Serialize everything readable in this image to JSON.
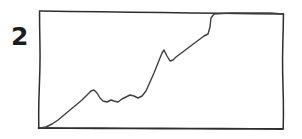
{
  "figure": {
    "label": "2",
    "label_color": "#1c1c1c",
    "background_color": "#ffffff",
    "ink_color": "#3f3f3f",
    "frame_color": "#2e2e2e",
    "width": 302,
    "height": 139
  },
  "chart_data": {
    "type": "line",
    "title": "",
    "subtitle": "",
    "xlabel": "",
    "ylabel": "",
    "annotations": [
      "2"
    ],
    "legend": [],
    "legend_position": "none",
    "grid": false,
    "axis_ticks": false,
    "tick_labels": [],
    "style": "hand-drawn sketch, monotone pencil line inside a hand-drawn rectangular frame",
    "xlim": [
      0,
      100
    ],
    "ylim": [
      0,
      100
    ],
    "x": [
      0,
      4,
      9,
      14,
      19,
      23,
      26,
      28,
      30,
      32,
      34,
      36,
      39,
      42,
      45,
      48,
      52,
      55,
      58,
      61,
      64,
      67,
      70,
      73,
      76,
      79,
      82,
      85,
      88,
      100
    ],
    "y": [
      0,
      2,
      9,
      17,
      24,
      31,
      35,
      32,
      28,
      27,
      29,
      27,
      30,
      33,
      32,
      30,
      36,
      48,
      60,
      72,
      68,
      64,
      66,
      71,
      76,
      81,
      86,
      97,
      98,
      98
    ],
    "series": [
      {
        "name": "sketched trend",
        "color": "#3f3f3f",
        "values": [
          0,
          2,
          9,
          17,
          24,
          31,
          35,
          32,
          28,
          27,
          29,
          27,
          30,
          33,
          32,
          30,
          36,
          48,
          60,
          72,
          68,
          64,
          66,
          71,
          76,
          81,
          86,
          97,
          98,
          98
        ]
      }
    ],
    "frame": {
      "top_left": [
        40,
        11
      ],
      "top_right": [
        283,
        14
      ],
      "bottom_right": [
        283,
        129
      ],
      "bottom_left": [
        39,
        128
      ]
    },
    "path_points_px": [
      [
        40,
        128
      ],
      [
        46,
        127
      ],
      [
        52,
        124
      ],
      [
        58,
        120
      ],
      [
        64,
        115
      ],
      [
        70,
        110
      ],
      [
        76,
        105
      ],
      [
        82,
        100
      ],
      [
        87,
        95
      ],
      [
        91,
        91
      ],
      [
        94,
        90
      ],
      [
        97,
        93
      ],
      [
        100,
        98
      ],
      [
        103,
        101
      ],
      [
        107,
        102
      ],
      [
        111,
        100
      ],
      [
        114,
        101
      ],
      [
        118,
        102
      ],
      [
        122,
        99
      ],
      [
        126,
        97
      ],
      [
        130,
        95
      ],
      [
        134,
        96
      ],
      [
        138,
        98
      ],
      [
        142,
        96
      ],
      [
        146,
        91
      ],
      [
        150,
        82
      ],
      [
        154,
        73
      ],
      [
        158,
        63
      ],
      [
        162,
        53
      ],
      [
        164,
        50
      ],
      [
        167,
        56
      ],
      [
        170,
        61
      ],
      [
        173,
        60
      ],
      [
        176,
        57
      ],
      [
        180,
        54
      ],
      [
        184,
        51
      ],
      [
        188,
        48
      ],
      [
        192,
        45
      ],
      [
        196,
        42
      ],
      [
        200,
        39
      ],
      [
        204,
        36
      ],
      [
        208,
        34
      ],
      [
        210,
        27
      ],
      [
        211,
        18
      ],
      [
        214,
        14
      ],
      [
        230,
        13
      ],
      [
        250,
        13
      ],
      [
        270,
        13
      ],
      [
        283,
        14
      ]
    ]
  }
}
